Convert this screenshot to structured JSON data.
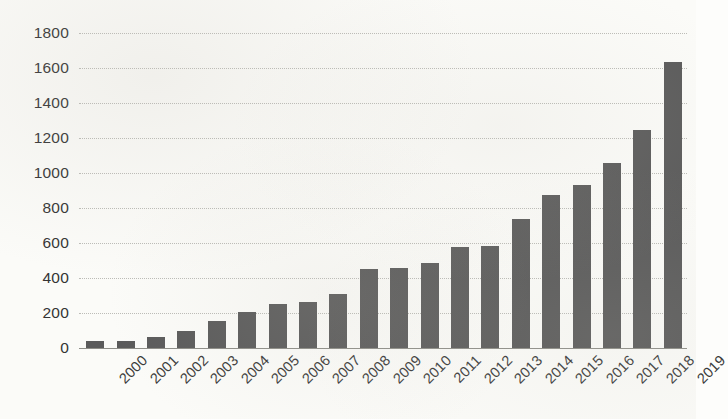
{
  "chart_data": {
    "type": "bar",
    "title": "",
    "subtitle": "",
    "xlabel": "",
    "ylabel": "",
    "categories": [
      "2000",
      "2001",
      "2002",
      "2003",
      "2004",
      "2005",
      "2006",
      "2007",
      "2008",
      "2009",
      "2010",
      "2011",
      "2012",
      "2013",
      "2014",
      "2015",
      "2016",
      "2017",
      "2018",
      "2019"
    ],
    "values": [
      40,
      40,
      65,
      100,
      155,
      205,
      250,
      265,
      310,
      450,
      455,
      485,
      575,
      585,
      740,
      875,
      930,
      1060,
      1245,
      1635
    ],
    "series": [
      {
        "name": "",
        "values": [
          40,
          40,
          65,
          100,
          155,
          205,
          250,
          265,
          310,
          450,
          455,
          485,
          575,
          585,
          740,
          875,
          930,
          1060,
          1245,
          1635
        ]
      }
    ],
    "ylim": [
      0,
      1800
    ],
    "yticks": [
      0,
      200,
      400,
      600,
      800,
      1000,
      1200,
      1400,
      1600,
      1800
    ],
    "ytick_labels": [
      "0",
      "200",
      "400",
      "600",
      "800",
      "1000",
      "1200",
      "1400",
      "1600",
      "1800"
    ],
    "grid": true,
    "grid_axis": "y",
    "legend": false,
    "legend_position": "none",
    "bar_color": "#5b5b5b",
    "background_color": "#fbfbf8",
    "gridline_color": "#b9b9b4",
    "axis_color": "#8e8e88",
    "tick_label_rotation": -45,
    "annotations": []
  }
}
